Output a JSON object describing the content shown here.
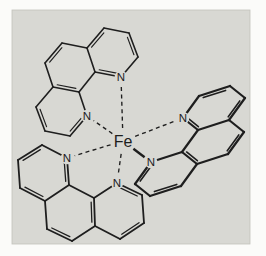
{
  "figure": {
    "type": "chemical-structure-diagram",
    "background_color": "#fbfbf9",
    "panel_color": "#d8d8d3",
    "panel_edge_color": "#c2c2bc",
    "line_color": "#1e1e1e",
    "panel": {
      "x": 12,
      "y": 10,
      "width": 238,
      "height": 234
    }
  },
  "molecule": {
    "center_atom": {
      "label": "Fe",
      "x": 123,
      "y": 141,
      "font_size": 16
    },
    "nitrogen_label": "N",
    "n_font_size": 11.5,
    "dash_pattern": "4 3.4",
    "dash_width": 1.35,
    "solid_bond_width": 2.4,
    "ligands": [
      {
        "name": "phen-ligand-top-left",
        "stroke_width": 1.6,
        "atoms": [
          [
            121,
            77
          ],
          [
            138,
            57
          ],
          [
            129,
            33
          ],
          [
            104,
            28
          ],
          [
            87,
            48
          ],
          [
            95,
            72
          ],
          [
            62,
            43
          ],
          [
            45,
            63
          ],
          [
            53,
            87
          ],
          [
            79,
            92
          ],
          [
            36,
            107
          ],
          [
            45,
            131
          ],
          [
            70,
            136
          ],
          [
            87,
            116
          ]
        ],
        "n_indices": [
          0,
          13
        ],
        "ring_centers": [
          [
            112,
            53
          ],
          [
            70,
            67
          ],
          [
            62,
            111
          ]
        ],
        "bonds": [
          [
            0,
            1,
            1,
            -1
          ],
          [
            1,
            2,
            2,
            0
          ],
          [
            2,
            3,
            1,
            -1
          ],
          [
            3,
            4,
            2,
            0
          ],
          [
            4,
            5,
            1,
            -1
          ],
          [
            5,
            0,
            2,
            0
          ],
          [
            4,
            6,
            1,
            -1
          ],
          [
            6,
            7,
            2,
            1
          ],
          [
            7,
            8,
            1,
            -1
          ],
          [
            8,
            9,
            2,
            1
          ],
          [
            9,
            5,
            1,
            -1
          ],
          [
            9,
            13,
            1,
            -1
          ],
          [
            13,
            12,
            2,
            2
          ],
          [
            12,
            11,
            1,
            -1
          ],
          [
            11,
            10,
            2,
            2
          ],
          [
            10,
            8,
            1,
            -1
          ]
        ]
      },
      {
        "name": "phen-ligand-right",
        "stroke_width": 2.2,
        "atoms": [
          [
            183,
            118
          ],
          [
            199,
            96
          ],
          [
            230,
            86
          ],
          [
            245,
            98
          ],
          [
            229,
            120
          ],
          [
            198,
            130
          ],
          [
            244,
            132
          ],
          [
            228,
            154
          ],
          [
            197,
            164
          ],
          [
            182,
            152
          ],
          [
            181,
            186
          ],
          [
            150,
            196
          ],
          [
            135,
            184
          ],
          [
            151,
            162
          ]
        ],
        "n_indices": [
          0,
          13
        ],
        "ring_centers": [
          [
            214,
            108
          ],
          [
            213,
            142
          ],
          [
            166,
            174
          ]
        ],
        "bonds": [
          [
            0,
            1,
            1,
            -1
          ],
          [
            1,
            2,
            2,
            0
          ],
          [
            2,
            3,
            1,
            -1
          ],
          [
            3,
            4,
            2,
            0
          ],
          [
            4,
            5,
            1,
            -1
          ],
          [
            5,
            0,
            2,
            0
          ],
          [
            4,
            6,
            1,
            -1
          ],
          [
            6,
            7,
            2,
            1
          ],
          [
            7,
            8,
            1,
            -1
          ],
          [
            8,
            9,
            2,
            1
          ],
          [
            9,
            5,
            1,
            -1
          ],
          [
            9,
            13,
            1,
            -1
          ],
          [
            13,
            12,
            2,
            2
          ],
          [
            12,
            11,
            1,
            -1
          ],
          [
            11,
            10,
            2,
            2
          ],
          [
            10,
            8,
            1,
            -1
          ]
        ]
      },
      {
        "name": "phen-ligand-bottom-left",
        "stroke_width": 1.8,
        "atoms": [
          [
            67,
            158
          ],
          [
            42,
            145
          ],
          [
            18,
            160
          ],
          [
            20,
            188
          ],
          [
            45,
            201
          ],
          [
            69,
            185
          ],
          [
            47,
            229
          ],
          [
            72,
            241
          ],
          [
            95,
            226
          ],
          [
            94,
            198
          ],
          [
            120,
            239
          ],
          [
            144,
            223
          ],
          [
            142,
            195
          ],
          [
            117,
            183
          ]
        ],
        "n_indices": [
          0,
          13
        ],
        "ring_centers": [
          [
            44,
            173
          ],
          [
            70,
            213
          ],
          [
            119,
            211
          ]
        ],
        "bonds": [
          [
            0,
            1,
            1,
            -1
          ],
          [
            1,
            2,
            2,
            0
          ],
          [
            2,
            3,
            1,
            -1
          ],
          [
            3,
            4,
            2,
            0
          ],
          [
            4,
            5,
            1,
            -1
          ],
          [
            5,
            0,
            2,
            0
          ],
          [
            4,
            6,
            1,
            -1
          ],
          [
            6,
            7,
            2,
            1
          ],
          [
            7,
            8,
            1,
            -1
          ],
          [
            8,
            9,
            2,
            1
          ],
          [
            9,
            5,
            1,
            -1
          ],
          [
            9,
            13,
            1,
            -1
          ],
          [
            13,
            12,
            2,
            2
          ],
          [
            12,
            11,
            1,
            -1
          ],
          [
            11,
            10,
            2,
            2
          ],
          [
            10,
            8,
            1,
            -1
          ]
        ]
      }
    ],
    "coordination_bonds": [
      {
        "ligand": 0,
        "n": 0,
        "style": "dashed"
      },
      {
        "ligand": 0,
        "n": 13,
        "style": "dashed"
      },
      {
        "ligand": 1,
        "n": 0,
        "style": "dashed"
      },
      {
        "ligand": 1,
        "n": 13,
        "style": "solid"
      },
      {
        "ligand": 2,
        "n": 0,
        "style": "dashed"
      },
      {
        "ligand": 2,
        "n": 13,
        "style": "dashed"
      }
    ]
  }
}
